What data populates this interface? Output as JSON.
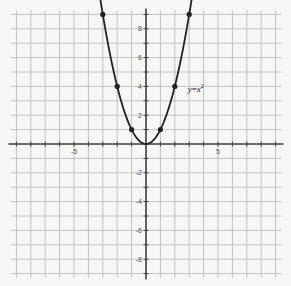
{
  "chart_data": {
    "type": "line",
    "title": "",
    "xlabel": "",
    "ylabel": "",
    "xlim": [
      -9,
      9
    ],
    "ylim": [
      -9,
      9
    ],
    "grid": true,
    "x_tick_labels": [
      {
        "value": -5,
        "label": "-5"
      },
      {
        "value": 5,
        "label": "5"
      }
    ],
    "y_tick_labels": [
      {
        "value": 8,
        "label": "8"
      },
      {
        "value": 6,
        "label": "6"
      },
      {
        "value": 4,
        "label": "4"
      },
      {
        "value": 2,
        "label": "2"
      },
      {
        "value": -2,
        "label": "-2"
      },
      {
        "value": -4,
        "label": "-4"
      },
      {
        "value": -6,
        "label": "-6"
      },
      {
        "value": -8,
        "label": "-8"
      }
    ],
    "series": [
      {
        "name": "y=x²",
        "function": "x^2",
        "curve_x_range": [
          -3.2,
          3.2
        ],
        "points": [
          {
            "x": -3,
            "y": 9
          },
          {
            "x": -2,
            "y": 4
          },
          {
            "x": -1,
            "y": 1
          },
          {
            "x": 0,
            "y": 0
          },
          {
            "x": 1,
            "y": 1
          },
          {
            "x": 2,
            "y": 4
          },
          {
            "x": 3,
            "y": 9
          }
        ]
      }
    ],
    "annotations": [
      {
        "text": "y=x²",
        "x": 2.9,
        "y": 3.6
      }
    ],
    "colors": {
      "grid": "#b5b5b5",
      "axis": "#444444",
      "curve": "#222222",
      "background": "#f7f7f5"
    }
  },
  "labels": {
    "equation_var": "y",
    "equation_eq": "=",
    "equation_x": "x",
    "equation_exp": "2"
  }
}
